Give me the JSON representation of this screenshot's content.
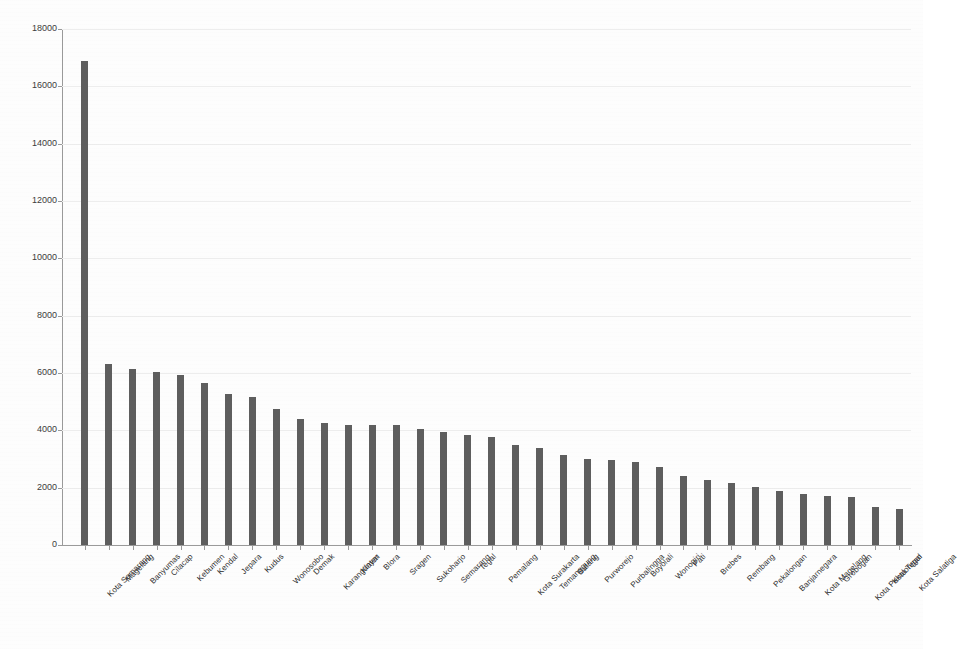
{
  "chart_data": {
    "type": "bar",
    "title": "",
    "subtitle": "",
    "xlabel": "",
    "ylabel": "",
    "ylim": [
      0,
      18000
    ],
    "y_ticks": [
      0,
      2000,
      4000,
      6000,
      8000,
      10000,
      12000,
      14000,
      16000,
      18000
    ],
    "y_tick_labels": [
      "0",
      "2000",
      "4000",
      "6000",
      "8000",
      "10000",
      "12000",
      "14000",
      "16000",
      "18000"
    ],
    "grid": true,
    "legend": false,
    "legend_position": "none",
    "bar_color": "#5e5e5e",
    "categories": [
      "Kota Semarang",
      "Magelang",
      "Banyumas",
      "Cilacap",
      "Kebumen",
      "Kendal",
      "Jepara",
      "Kudus",
      "Wonosobo",
      "Demak",
      "Karanganyar",
      "Klaten",
      "Blora",
      "Sragen",
      "Sukoharjo",
      "Semarang",
      "Tegal",
      "Pemalang",
      "Kota Surakarta",
      "Temanggung",
      "Batang",
      "Purworejo",
      "Purbalingga",
      "Boyolali",
      "Wonogiri",
      "Pati",
      "Brebes",
      "Rembang",
      "Pekalongan",
      "Banjarnegara",
      "Kota Magelang",
      "Grobogan",
      "Kota Pekalongan",
      "Kota Tegal",
      "Kota Salatiga"
    ],
    "values": [
      16900,
      6300,
      6150,
      6050,
      5930,
      5650,
      5280,
      5180,
      4730,
      4380,
      4250,
      4200,
      4200,
      4180,
      4050,
      3930,
      3850,
      3780,
      3480,
      3380,
      3150,
      3000,
      2960,
      2880,
      2720,
      2400,
      2280,
      2150,
      2030,
      1870,
      1780,
      1720,
      1680,
      1340,
      1250
    ]
  }
}
